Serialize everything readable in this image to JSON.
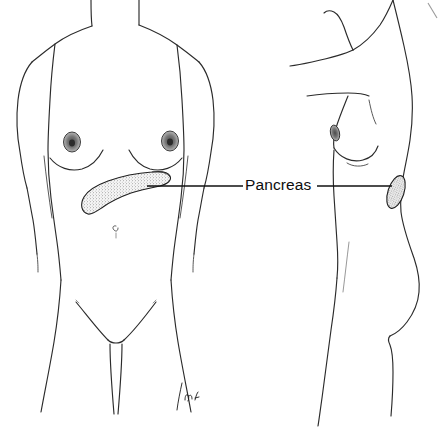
{
  "illustration": {
    "title": "Pancreas anatomical location illustration",
    "subject": "female human body, anterior and lateral views",
    "background_color": "#ffffff",
    "line_color": "#2b2b2b",
    "label_color": "#0d0d0d",
    "organ_fill_color": "#efefef",
    "organ_stipple_color": "#4a4a4a"
  },
  "labels": {
    "pancreas": "Pancreas"
  },
  "views": {
    "anterior": {
      "name": "anterior-view",
      "description": "front view of female torso and legs",
      "organ_label": "Pancreas",
      "parts": [
        "neck",
        "shoulders",
        "left-arm",
        "right-arm",
        "breasts",
        "areola-left",
        "areola-right",
        "abdomen",
        "navel",
        "hips",
        "thighs",
        "pubic-outline"
      ]
    },
    "lateral": {
      "name": "lateral-view",
      "description": "side view of female torso with raised arm",
      "organ_label": "Pancreas",
      "parts": [
        "raised-arm",
        "shoulder",
        "back",
        "breast-profile",
        "nipple",
        "abdomen",
        "buttock",
        "thigh"
      ]
    }
  },
  "organs": [
    {
      "name": "pancreas-anterior",
      "view": "anterior",
      "texture": "stippled",
      "shape": "comma-shaped with bulbous head lower-left and tapering tail upper-right"
    },
    {
      "name": "pancreas-lateral",
      "view": "lateral",
      "texture": "stippled",
      "shape": "small tilted ellipse"
    }
  ],
  "annotations": {
    "leader_line_left": "connects anterior pancreas to label",
    "leader_line_right": "connects label to lateral pancreas",
    "signature": "M.b."
  }
}
